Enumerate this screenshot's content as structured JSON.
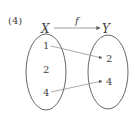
{
  "problem_number": "(4)",
  "function_label": "f",
  "domain_set": {
    "name": "X",
    "elements": [
      "1",
      "2",
      "4"
    ]
  },
  "codomain_set": {
    "name": "Y",
    "elements": [
      "2",
      "4"
    ]
  },
  "mappings": [
    {
      "from": "1",
      "to": "2"
    },
    {
      "from": "4",
      "to": "4"
    }
  ],
  "colors": {
    "stroke": "#555555",
    "text": "#444444"
  }
}
